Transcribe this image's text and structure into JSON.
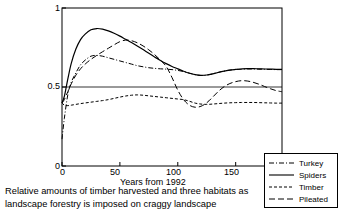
{
  "chart_data": {
    "type": "line",
    "title": "",
    "xlabel": "Years from 1992",
    "ylabel": "",
    "xlim": [
      0,
      190
    ],
    "ylim": [
      0,
      1
    ],
    "xticks": [
      "0",
      "50",
      "100",
      "150"
    ],
    "xtick_values": [
      0,
      50,
      100,
      150
    ],
    "yticks": [
      "0",
      "0.5",
      "1"
    ],
    "ytick_values": [
      0,
      0.5,
      1
    ],
    "grid": "horizontal reference line at y = 0.5 spanning full plot width",
    "legend_position": "outside bottom-right",
    "x": [
      0,
      2,
      5,
      8,
      12,
      16,
      20,
      25,
      30,
      35,
      40,
      45,
      50,
      55,
      60,
      65,
      70,
      75,
      80,
      85,
      90,
      95,
      100,
      105,
      110,
      115,
      120,
      125,
      130,
      135,
      140,
      145,
      150,
      155,
      160,
      165,
      170,
      175,
      180,
      185,
      190
    ],
    "series": [
      {
        "name": "Turkey",
        "linestyle": "dash-dot",
        "color": "#000000",
        "values": [
          0.17,
          0.3,
          0.45,
          0.53,
          0.59,
          0.64,
          0.67,
          0.695,
          0.7,
          0.695,
          0.685,
          0.675,
          0.665,
          0.655,
          0.645,
          0.635,
          0.628,
          0.622,
          0.618,
          0.615,
          0.613,
          0.61,
          0.605,
          0.598,
          0.588,
          0.578,
          0.573,
          0.575,
          0.583,
          0.593,
          0.601,
          0.607,
          0.611,
          0.613,
          0.614,
          0.614,
          0.613,
          0.612,
          0.611,
          0.61,
          0.61
        ]
      },
      {
        "name": "Spiders",
        "linestyle": "solid",
        "color": "#000000",
        "values": [
          0.4,
          0.44,
          0.55,
          0.65,
          0.74,
          0.8,
          0.835,
          0.862,
          0.87,
          0.866,
          0.855,
          0.84,
          0.822,
          0.802,
          0.782,
          0.76,
          0.737,
          0.713,
          0.69,
          0.668,
          0.648,
          0.63,
          0.615,
          0.6,
          0.587,
          0.578,
          0.574,
          0.576,
          0.583,
          0.592,
          0.6,
          0.607,
          0.611,
          0.614,
          0.616,
          0.616,
          0.615,
          0.614,
          0.613,
          0.612,
          0.612
        ]
      },
      {
        "name": "Timber",
        "linestyle": "short-dash",
        "color": "#000000",
        "values": [
          0.4,
          0.385,
          0.382,
          0.385,
          0.39,
          0.395,
          0.399,
          0.404,
          0.409,
          0.414,
          0.42,
          0.428,
          0.436,
          0.443,
          0.448,
          0.45,
          0.448,
          0.444,
          0.44,
          0.436,
          0.432,
          0.428,
          0.424,
          0.42,
          0.41,
          0.398,
          0.392,
          0.39,
          0.392,
          0.395,
          0.398,
          0.4,
          0.401,
          0.402,
          0.402,
          0.402,
          0.401,
          0.4,
          0.399,
          0.398,
          0.398
        ]
      },
      {
        "name": "Pileated",
        "linestyle": "long-dash",
        "color": "#000000",
        "values": [
          0.4,
          0.42,
          0.47,
          0.52,
          0.575,
          0.615,
          0.645,
          0.675,
          0.7,
          0.723,
          0.745,
          0.767,
          0.787,
          0.797,
          0.793,
          0.78,
          0.76,
          0.735,
          0.705,
          0.67,
          0.63,
          0.56,
          0.48,
          0.42,
          0.385,
          0.372,
          0.378,
          0.4,
          0.435,
          0.472,
          0.502,
          0.522,
          0.534,
          0.54,
          0.538,
          0.53,
          0.518,
          0.503,
          0.489,
          0.477,
          0.47
        ]
      }
    ]
  },
  "legend": {
    "items": [
      {
        "label": "Turkey"
      },
      {
        "label": "Spiders"
      },
      {
        "label": "Timber"
      },
      {
        "label": "Pileated"
      }
    ]
  },
  "caption": {
    "line1": "Relative amounts of timber harvested and three habitats as",
    "line2": "landscape forestry is imposed on craggy landscape"
  }
}
